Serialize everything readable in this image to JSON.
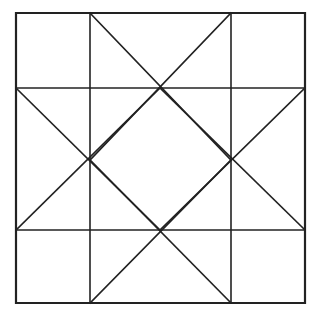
{
  "figure": {
    "title": "Star Quilt Block Geometric Line Figure",
    "background_color": "#ffffff",
    "stroke_color": "#222222",
    "stroke_width": 1.6,
    "outer_stroke_width": 2.2,
    "canvas": {
      "width": 318,
      "height": 318
    },
    "bounds": {
      "left": 16,
      "top": 13,
      "right": 305,
      "bottom": 303
    },
    "grid": {
      "vertical_x": [
        90,
        231
      ],
      "horizontal_y": [
        88,
        230
      ]
    },
    "outer_square": {
      "label": "outer-square",
      "points": "16,13 305,13 305,303 16,303"
    },
    "interior_lines": [
      {
        "label": "vertical-left",
        "x1": 90,
        "y1": 13,
        "x2": 90,
        "y2": 303
      },
      {
        "label": "vertical-right",
        "x1": 231,
        "y1": 13,
        "x2": 231,
        "y2": 303
      },
      {
        "label": "horizontal-upper",
        "x1": 16,
        "y1": 88,
        "x2": 305,
        "y2": 88
      },
      {
        "label": "horizontal-lower",
        "x1": 16,
        "y1": 230,
        "x2": 305,
        "y2": 230
      }
    ],
    "diagonals": [
      {
        "label": "diagonal-top-left-down",
        "x1": 90,
        "y1": 13,
        "x2": 231,
        "y2": 160
      },
      {
        "label": "diagonal-top-right-down",
        "x1": 231,
        "y1": 13,
        "x2": 90,
        "y2": 160
      },
      {
        "label": "diagonal-left-top-right",
        "x1": 16,
        "y1": 88,
        "x2": 160,
        "y2": 230
      },
      {
        "label": "diagonal-left-bottom-right",
        "x1": 16,
        "y1": 230,
        "x2": 160,
        "y2": 88
      },
      {
        "label": "diagonal-right-top-left",
        "x1": 305,
        "y1": 88,
        "x2": 160,
        "y2": 230
      },
      {
        "label": "diagonal-right-bottom-left",
        "x1": 305,
        "y1": 230,
        "x2": 160,
        "y2": 88
      },
      {
        "label": "diagonal-bottom-left-up",
        "x1": 90,
        "y1": 303,
        "x2": 231,
        "y2": 160
      },
      {
        "label": "diagonal-bottom-right-up",
        "x1": 231,
        "y1": 303,
        "x2": 90,
        "y2": 160
      }
    ],
    "crossings": [
      {
        "label": "crossing-top",
        "x": 160,
        "y": 88
      },
      {
        "label": "crossing-left",
        "x": 90,
        "y": 158
      },
      {
        "label": "crossing-right",
        "x": 231,
        "y": 158
      },
      {
        "label": "crossing-bottom",
        "x": 160,
        "y": 230
      }
    ],
    "central_diamond": {
      "label": "central-diamond",
      "points": "160,88 231,159 160,230 90,159"
    }
  }
}
